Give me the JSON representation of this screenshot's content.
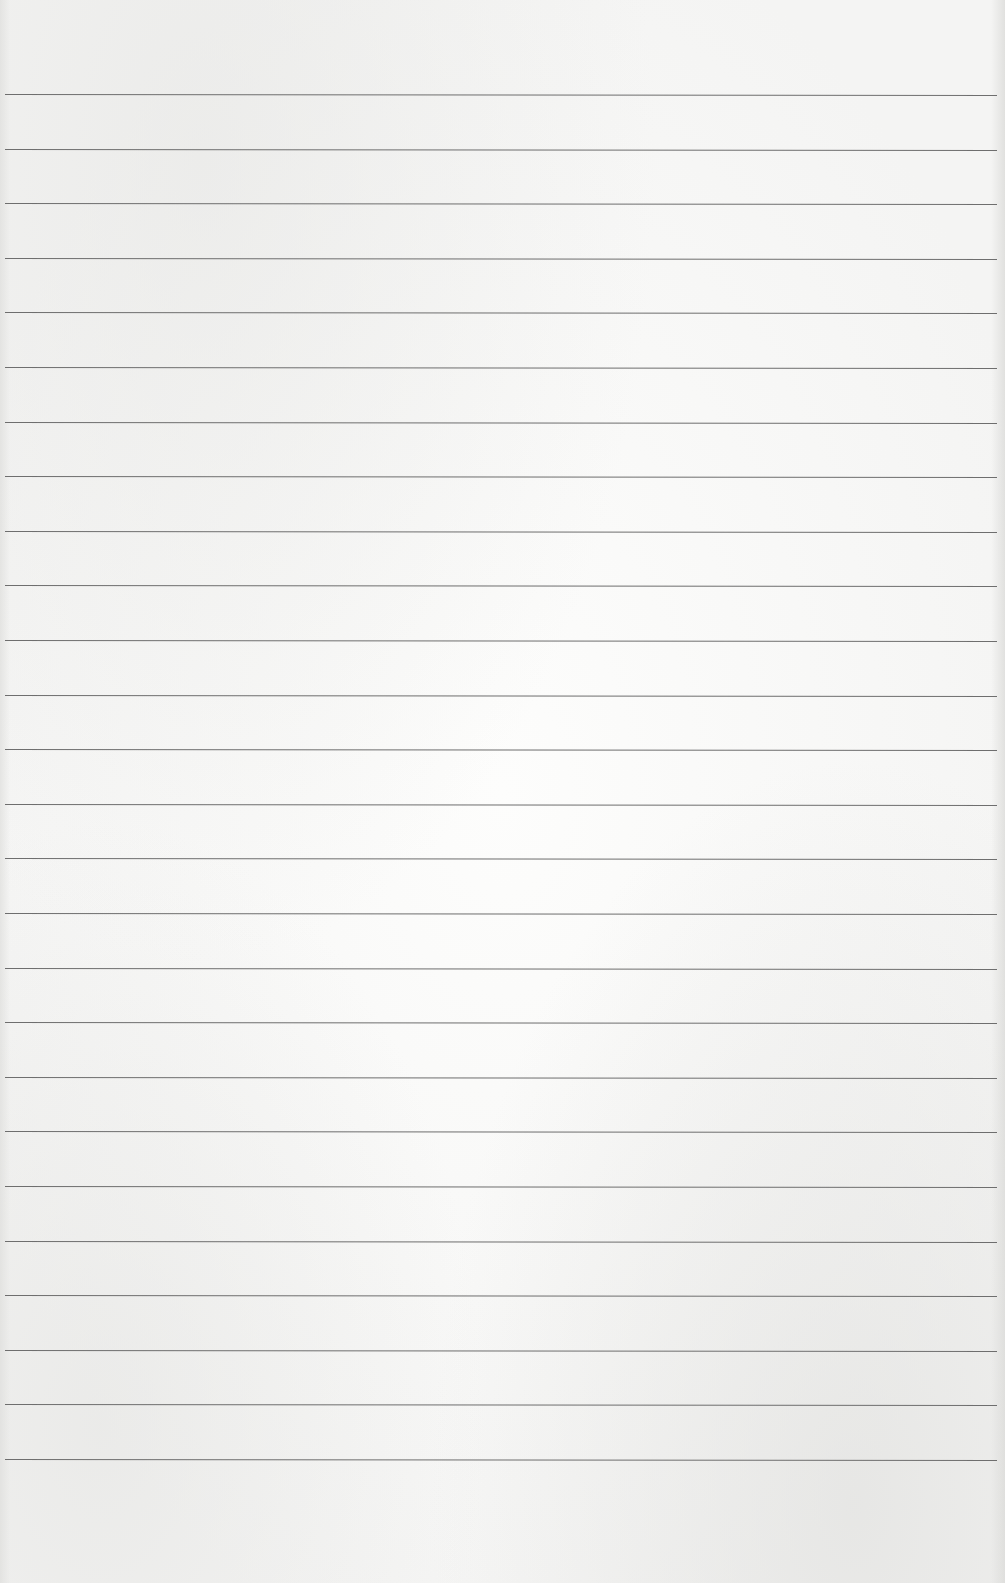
{
  "page": {
    "type": "blank lined paper",
    "background_color": "#f6f6f5",
    "line_color": "#6e6e6e",
    "rule_count": 26,
    "first_rule_y": 94,
    "rule_spacing": 54.6
  }
}
